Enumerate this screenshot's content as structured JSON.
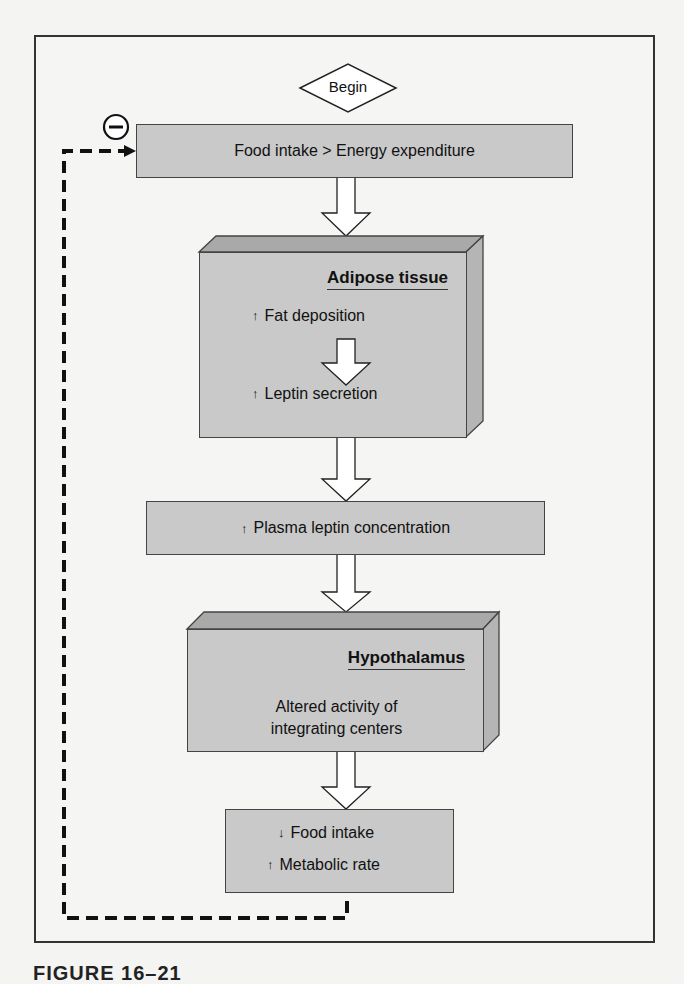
{
  "begin": {
    "label": "Begin"
  },
  "feedback": {
    "symbol": "minus-icon",
    "sign": "−"
  },
  "steps": {
    "intake": {
      "text": "Food intake > Energy expenditure"
    },
    "adipose": {
      "title": "Adipose tissue",
      "line1": {
        "arrow": "↑",
        "text": "Fat deposition"
      },
      "line2": {
        "arrow": "↑",
        "text": "Leptin secretion"
      }
    },
    "plasma": {
      "arrow": "↑",
      "text": "Plasma leptin concentration"
    },
    "hypothalamus": {
      "title": "Hypothalamus",
      "line1": "Altered activity of",
      "line2": "integrating centers"
    },
    "outcome": {
      "line1": {
        "arrow": "↓",
        "text": "Food intake"
      },
      "line2": {
        "arrow": "↑",
        "text": "Metabolic rate"
      }
    }
  },
  "caption": "FIGURE 16–21",
  "colors": {
    "box_fill": "#c9c9c9",
    "bevel_top": "#a9a9a9",
    "bevel_side": "#b5b5b5",
    "background": "#f4f4f3"
  }
}
